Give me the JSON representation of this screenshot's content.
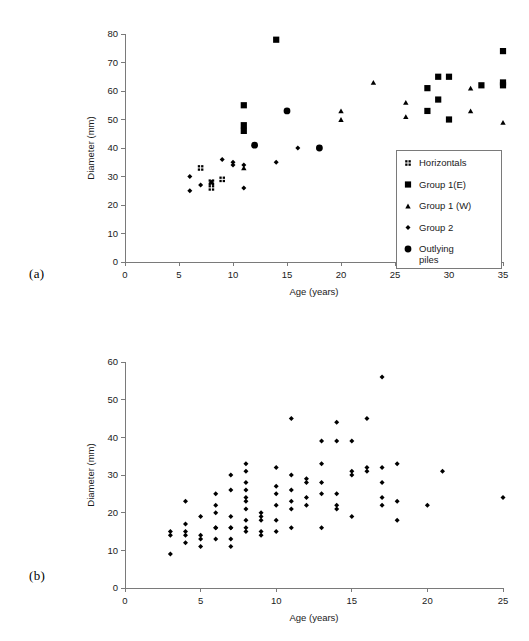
{
  "figure": {
    "panel_a_letter": "(a)",
    "panel_b_letter": "(b)"
  },
  "chart_data": [
    {
      "id": "panel-a",
      "type": "scatter",
      "title": "",
      "xlabel": "Age (years)",
      "ylabel": "Diameter (mm)",
      "xlim": [
        0,
        35
      ],
      "ylim": [
        0,
        80
      ],
      "xticks": [
        0,
        5,
        10,
        15,
        20,
        25,
        30,
        35
      ],
      "yticks": [
        0,
        10,
        20,
        30,
        40,
        50,
        60,
        70,
        80
      ],
      "grid": false,
      "legend_position": "inside-right",
      "series": [
        {
          "name": "Horizontals",
          "marker": "quad-square",
          "points": [
            [
              7,
              33
            ],
            [
              8,
              28
            ],
            [
              8,
              26
            ],
            [
              9,
              29
            ]
          ]
        },
        {
          "name": "Group 1(E)",
          "marker": "square",
          "points": [
            [
              11,
              55
            ],
            [
              11,
              48
            ],
            [
              11,
              46
            ],
            [
              14,
              78
            ],
            [
              28,
              61
            ],
            [
              28,
              53
            ],
            [
              29,
              65
            ],
            [
              29,
              57
            ],
            [
              30,
              65
            ],
            [
              30,
              50
            ],
            [
              33,
              62
            ],
            [
              35,
              74
            ],
            [
              35,
              63
            ],
            [
              35,
              62
            ]
          ]
        },
        {
          "name": "Group 1 (W)",
          "marker": "triangle",
          "points": [
            [
              11,
              33
            ],
            [
              20,
              53
            ],
            [
              20,
              50
            ],
            [
              23,
              63
            ],
            [
              26,
              56
            ],
            [
              26,
              51
            ],
            [
              32,
              61
            ],
            [
              32,
              53
            ],
            [
              35,
              49
            ]
          ]
        },
        {
          "name": "Group 2",
          "marker": "small-diamond",
          "points": [
            [
              6,
              30
            ],
            [
              6,
              25
            ],
            [
              7,
              27
            ],
            [
              8,
              28
            ],
            [
              9,
              36
            ],
            [
              10,
              35
            ],
            [
              10,
              34
            ],
            [
              11,
              34
            ],
            [
              11,
              26
            ],
            [
              14,
              35
            ],
            [
              16,
              40
            ]
          ]
        },
        {
          "name": "Outlying piles",
          "marker": "circle",
          "points": [
            [
              12,
              41
            ],
            [
              15,
              53
            ],
            [
              18,
              40
            ]
          ]
        }
      ]
    },
    {
      "id": "panel-b",
      "type": "scatter",
      "title": "",
      "xlabel": "Age (years)",
      "ylabel": "Diameter (mm)",
      "xlim": [
        0,
        25
      ],
      "ylim": [
        0,
        60
      ],
      "xticks": [
        0,
        5,
        10,
        15,
        20,
        25
      ],
      "yticks": [
        0,
        10,
        20,
        30,
        40,
        50,
        60
      ],
      "grid": false,
      "legend_position": "none",
      "series": [
        {
          "name": "piles",
          "marker": "small-diamond",
          "points": [
            [
              3,
              15
            ],
            [
              3,
              14
            ],
            [
              3,
              9
            ],
            [
              4,
              23
            ],
            [
              4,
              17
            ],
            [
              4,
              15
            ],
            [
              4,
              14
            ],
            [
              4,
              12
            ],
            [
              5,
              19
            ],
            [
              5,
              14
            ],
            [
              5,
              13
            ],
            [
              5,
              11
            ],
            [
              6,
              25
            ],
            [
              6,
              22
            ],
            [
              6,
              20
            ],
            [
              6,
              16
            ],
            [
              6,
              16
            ],
            [
              6,
              13
            ],
            [
              7,
              30
            ],
            [
              7,
              26
            ],
            [
              7,
              19
            ],
            [
              7,
              16
            ],
            [
              7,
              16
            ],
            [
              7,
              13
            ],
            [
              7,
              11
            ],
            [
              8,
              33
            ],
            [
              8,
              31
            ],
            [
              8,
              28
            ],
            [
              8,
              26
            ],
            [
              8,
              24
            ],
            [
              8,
              23
            ],
            [
              8,
              21
            ],
            [
              8,
              18
            ],
            [
              8,
              16
            ],
            [
              8,
              15
            ],
            [
              9,
              20
            ],
            [
              9,
              19
            ],
            [
              9,
              18
            ],
            [
              9,
              15
            ],
            [
              9,
              14
            ],
            [
              10,
              32
            ],
            [
              10,
              27
            ],
            [
              10,
              25
            ],
            [
              10,
              22
            ],
            [
              10,
              18
            ],
            [
              10,
              15
            ],
            [
              11,
              45
            ],
            [
              11,
              30
            ],
            [
              11,
              26
            ],
            [
              11,
              23
            ],
            [
              11,
              21
            ],
            [
              11,
              16
            ],
            [
              12,
              29
            ],
            [
              12,
              28
            ],
            [
              12,
              24
            ],
            [
              12,
              22
            ],
            [
              13,
              39
            ],
            [
              13,
              33
            ],
            [
              13,
              28
            ],
            [
              13,
              25
            ],
            [
              13,
              16
            ],
            [
              14,
              44
            ],
            [
              14,
              39
            ],
            [
              14,
              25
            ],
            [
              14,
              22
            ],
            [
              14,
              21
            ],
            [
              15,
              39
            ],
            [
              15,
              31
            ],
            [
              15,
              30
            ],
            [
              15,
              19
            ],
            [
              16,
              45
            ],
            [
              16,
              32
            ],
            [
              16,
              31
            ],
            [
              17,
              56
            ],
            [
              17,
              32
            ],
            [
              17,
              28
            ],
            [
              17,
              24
            ],
            [
              17,
              22
            ],
            [
              18,
              33
            ],
            [
              18,
              23
            ],
            [
              18,
              18
            ],
            [
              20,
              22
            ],
            [
              21,
              31
            ],
            [
              25,
              24
            ]
          ]
        }
      ]
    }
  ]
}
